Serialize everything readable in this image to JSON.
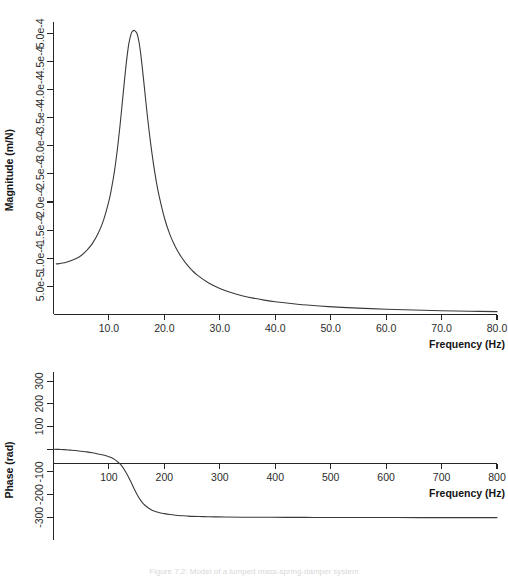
{
  "figure": {
    "caption": "Figure 7.2: Model of a lumped mass-spring-damper system",
    "background": "#ffffff",
    "curve_color": "#3a3a3a",
    "axis_color": "#262626"
  },
  "chart_data": [
    {
      "type": "line",
      "id": "magnitude-plot",
      "title": "",
      "xlabel": "Frequency (Hz)",
      "ylabel": "Magnitude (m/N)",
      "xlim": [
        0,
        80
      ],
      "ylim": [
        0,
        0.00052
      ],
      "grid": false,
      "legend": "none",
      "xticks": [
        10.0,
        20.0,
        30.0,
        40.0,
        50.0,
        60.0,
        70.0,
        80.0
      ],
      "xticklabels": [
        "10.0",
        "20.0",
        "30.0",
        "40.0",
        "50.0",
        "60.0",
        "70.0",
        "80.0"
      ],
      "yticks": [
        5e-05,
        0.0001,
        0.00015,
        0.0002,
        0.00025,
        0.0003,
        0.00035,
        0.0004,
        0.00045,
        0.0005
      ],
      "yticklabels": [
        "5.0e-5",
        "1.0e-4",
        "1.5e-4",
        "2.0e-4",
        "2.5e-4",
        "3.0e-4",
        "3.5e-4",
        "4.0e-4",
        "4.5e-4",
        "5.0e-4"
      ],
      "resonance_hz": 15.0,
      "peak_value": 0.000505,
      "static_value": 9e-05,
      "damping_ratio": 0.09,
      "x": [
        0.5,
        1,
        2,
        3,
        4,
        5,
        6,
        7,
        8,
        9,
        10,
        10.5,
        11,
        11.5,
        12,
        12.5,
        13,
        13.3,
        13.6,
        14,
        14.3,
        14.6,
        14.9,
        15.0,
        15.2,
        15.5,
        15.8,
        16.2,
        16.6,
        17,
        17.5,
        18,
        18.5,
        19,
        20,
        21,
        22,
        23,
        24,
        25,
        26,
        28,
        30,
        32,
        34,
        36,
        38,
        40,
        44,
        48,
        52,
        56,
        60,
        65,
        70,
        75,
        80
      ],
      "y": [
        9e-05,
        9.05e-05,
        9.2e-05,
        9.5e-05,
        9.9e-05,
        0.000105,
        0.000114,
        0.000126,
        0.000143,
        0.000167,
        0.000202,
        0.000226,
        0.000255,
        0.000292,
        0.000336,
        0.000386,
        0.000435,
        0.000461,
        0.000482,
        0.000499,
        0.000504,
        0.000505,
        0.000502,
        0.000501,
        0.000495,
        0.00048,
        0.000458,
        0.000422,
        0.000384,
        0.000347,
        0.000306,
        0.00027,
        0.000239,
        0.000213,
        0.000172,
        0.000142,
        0.00012,
        0.000103,
        8.94e-05,
        7.85e-05,
        6.96e-05,
        5.6e-05,
        4.63e-05,
        3.9e-05,
        3.35e-05,
        2.91e-05,
        2.56e-05,
        2.27e-05,
        1.83e-05,
        1.51e-05,
        1.27e-05,
        1.09e-05,
        9.4e-06,
        7.9e-06,
        6.8e-06,
        5.9e-06,
        5.1e-06
      ]
    },
    {
      "type": "line",
      "id": "phase-plot",
      "title": "",
      "xlabel": "Frequency (Hz)",
      "ylabel": "Phase (rad)",
      "xlim": [
        0,
        800
      ],
      "ylim": [
        -400,
        340
      ],
      "grid": false,
      "legend": "none",
      "xticks": [
        100,
        200,
        300,
        400,
        500,
        600,
        700,
        800
      ],
      "xticklabels": [
        "100",
        "200",
        "300",
        "400",
        "500",
        "600",
        "700",
        "800"
      ],
      "yticks": [
        300,
        200,
        100,
        0,
        -100,
        -200,
        -300
      ],
      "yticklabels": [
        "300",
        "200",
        "100",
        "",
        "-100",
        "-200",
        "-300"
      ],
      "transition_hz": 150,
      "asymptote": -300,
      "x": [
        0,
        10,
        20,
        30,
        40,
        50,
        60,
        70,
        80,
        90,
        100,
        105,
        110,
        115,
        120,
        125,
        130,
        135,
        140,
        145,
        150,
        155,
        160,
        165,
        170,
        175,
        180,
        190,
        200,
        210,
        220,
        230,
        240,
        250,
        270,
        290,
        310,
        340,
        380,
        420,
        470,
        520,
        570,
        620,
        680,
        740,
        800
      ],
      "y": [
        0,
        -1,
        -2,
        -4,
        -6,
        -9,
        -12,
        -16,
        -21,
        -26,
        -33,
        -38,
        -45,
        -54,
        -65,
        -80,
        -99,
        -121,
        -146,
        -172,
        -196,
        -217,
        -234,
        -247,
        -257,
        -265,
        -271,
        -279,
        -284,
        -288,
        -291,
        -293,
        -294,
        -296,
        -297,
        -298,
        -299,
        -299.5,
        -300,
        -300.3,
        -300.6,
        -300.8,
        -301,
        -301.1,
        -301.3,
        -301.4,
        -301.5
      ]
    }
  ]
}
